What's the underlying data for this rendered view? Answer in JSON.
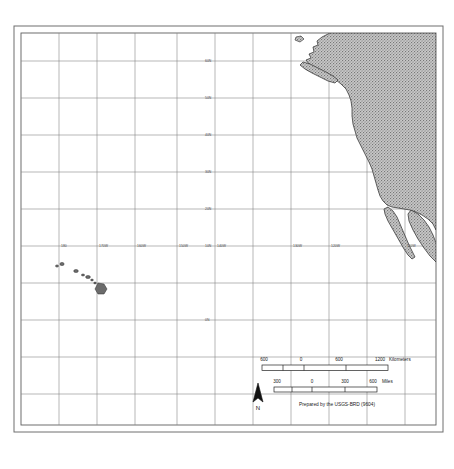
{
  "map": {
    "title": "Pacific Ocean and western North America reference map",
    "frame": {
      "outer": {
        "x": 14,
        "y": 26,
        "width": 429,
        "height": 406
      },
      "inner": {
        "x": 21,
        "y": 33,
        "width": 415,
        "height": 392
      }
    },
    "graticule": {
      "grid_visible": true,
      "grid_color": "#7d7d7d",
      "vertical_spacing_px": 38,
      "horizontal_spacing_px": 37,
      "latitude_labels": [
        "60N",
        "50N",
        "40N",
        "30N",
        "20N",
        "10N",
        "0N"
      ],
      "longitude_labels": [
        "180",
        "170W",
        "160W",
        "150W",
        "140W",
        "130W",
        "120W",
        "110W"
      ]
    },
    "land": {
      "fill_description": "gray stippled halftone",
      "fill_color": "#9a9a9a",
      "outline_color": "#3a3a3a",
      "features": [
        "North America west coast",
        "Vancouver Island",
        "Baja California peninsula",
        "Gulf of California",
        "Hawaiian Islands"
      ]
    },
    "hawaii": {
      "label": "Hawaiian Islands",
      "island_count": 8
    },
    "legend": {
      "kilometers": {
        "unit": "Kilometers",
        "ticks": [
          "600",
          "0",
          "600",
          "1200"
        ]
      },
      "miles": {
        "unit": "Miles",
        "ticks": [
          "300",
          "0",
          "300",
          "600"
        ]
      },
      "north_arrow_label": "N",
      "credit": "Prepared by the USGS-BRD (9604)"
    }
  }
}
